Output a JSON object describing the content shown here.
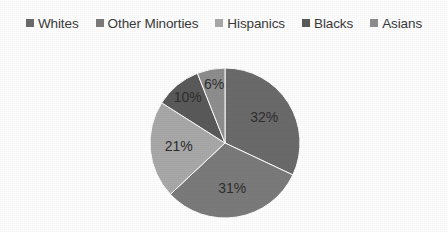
{
  "chart_data": {
    "type": "pie",
    "title": "",
    "categories": [
      "Whites",
      "Other Minorties",
      "Hispanics",
      "Blacks",
      "Asians"
    ],
    "values": [
      32,
      31,
      21,
      10,
      6
    ],
    "value_labels": [
      "32%",
      "31%",
      "21%",
      "10%",
      "6%"
    ],
    "units": "percent",
    "total": 100,
    "start_angle_deg": 0,
    "direction": "clockwise",
    "legend_position": "top",
    "grid": false,
    "colors": [
      "#6b6b6b",
      "#7b7b7b",
      "#a9a9a9",
      "#5a5a5a",
      "#8e8e8e"
    ],
    "background_color": "#ffffff",
    "label_color": "#2e2e2e",
    "series": [
      {
        "name": "Population share",
        "points": [
          {
            "category": "Whites",
            "value": 32,
            "label": "32%",
            "color": "#6b6b6b"
          },
          {
            "category": "Other Minorties",
            "value": 31,
            "label": "31%",
            "color": "#7b7b7b"
          },
          {
            "category": "Hispanics",
            "value": 21,
            "label": "21%",
            "color": "#a9a9a9"
          },
          {
            "category": "Blacks",
            "value": 10,
            "label": "10%",
            "color": "#5a5a5a"
          },
          {
            "category": "Asians",
            "value": 6,
            "label": "6%",
            "color": "#8e8e8e"
          }
        ]
      }
    ]
  },
  "legend": {
    "items": [
      {
        "label": "Whites",
        "color": "#6b6b6b",
        "marker": "square-marker"
      },
      {
        "label": "Other Minorties",
        "color": "#7b7b7b",
        "marker": "square-marker"
      },
      {
        "label": "Hispanics",
        "color": "#a9a9a9",
        "marker": "square-marker"
      },
      {
        "label": "Blacks",
        "color": "#5a5a5a",
        "marker": "square-marker"
      },
      {
        "label": "Asians",
        "color": "#8e8e8e",
        "marker": "square-marker"
      }
    ]
  }
}
